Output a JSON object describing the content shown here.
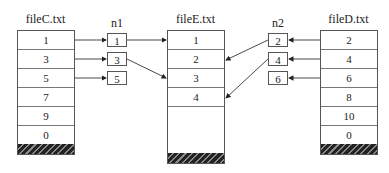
{
  "diagram": {
    "fileC": {
      "title": "fileC.txt",
      "rows": [
        "1",
        "3",
        "5",
        "7",
        "9",
        "0"
      ]
    },
    "n1": {
      "title": "n1",
      "items": [
        "1",
        "3",
        "5"
      ]
    },
    "fileE": {
      "title": "fileE.txt",
      "rows": [
        "1",
        "2",
        "3",
        "4"
      ]
    },
    "n2": {
      "title": "n2",
      "items": [
        "2",
        "4",
        "6"
      ]
    },
    "fileD": {
      "title": "fileD.txt",
      "rows": [
        "2",
        "4",
        "6",
        "8",
        "10",
        "0"
      ]
    }
  }
}
